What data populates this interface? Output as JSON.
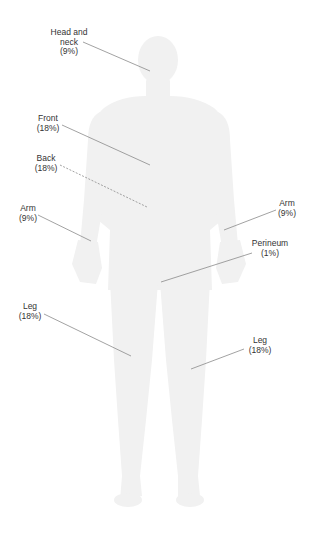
{
  "diagram": {
    "title": "",
    "figure": "human-body-silhouette",
    "colors": {
      "silhouette": "#f1f1f1",
      "leader_line": "#8a8a8a",
      "text": "#333333",
      "background": "#ffffff"
    },
    "regions": [
      {
        "id": "head-neck",
        "name_lines": [
          "Head and",
          "neck"
        ],
        "percent": "(9%)",
        "value": 9,
        "line_style": "solid",
        "label_pos": [
          69,
          28
        ],
        "line": [
          83,
          42,
          150,
          71
        ]
      },
      {
        "id": "front",
        "name_lines": [
          "Front"
        ],
        "percent": "(18%)",
        "value": 18,
        "line_style": "solid",
        "label_pos": [
          48,
          114
        ],
        "line": [
          62,
          125,
          150,
          165
        ]
      },
      {
        "id": "back",
        "name_lines": [
          "Back"
        ],
        "percent": "(18%)",
        "value": 18,
        "line_style": "dashed",
        "label_pos": [
          46,
          154
        ],
        "line": [
          60,
          165,
          147,
          207
        ]
      },
      {
        "id": "arm-left",
        "name_lines": [
          "Arm"
        ],
        "percent": "(9%)",
        "value": 9,
        "line_style": "solid",
        "label_pos": [
          28,
          204
        ],
        "line": [
          38,
          215,
          91,
          241
        ]
      },
      {
        "id": "arm-right",
        "name_lines": [
          "Arm"
        ],
        "percent": "(9%)",
        "value": 9,
        "line_style": "solid",
        "label_pos": [
          287,
          199
        ],
        "line": [
          276,
          210,
          224,
          230
        ]
      },
      {
        "id": "perineum",
        "name_lines": [
          "Perineum"
        ],
        "percent": "(1%)",
        "value": 1,
        "line_style": "solid",
        "label_pos": [
          270,
          239
        ],
        "line": [
          252,
          253,
          161,
          282
        ]
      },
      {
        "id": "leg-left",
        "name_lines": [
          "Leg"
        ],
        "percent": "(18%)",
        "value": 18,
        "line_style": "solid",
        "label_pos": [
          30,
          302
        ],
        "line": [
          44,
          314,
          131,
          356
        ]
      },
      {
        "id": "leg-right",
        "name_lines": [
          "Leg"
        ],
        "percent": "(18%)",
        "value": 18,
        "line_style": "solid",
        "label_pos": [
          260,
          336
        ],
        "line": [
          244,
          349,
          191,
          369
        ]
      }
    ]
  }
}
